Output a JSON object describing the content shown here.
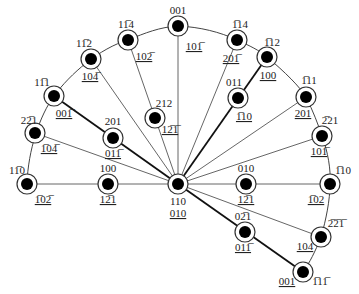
{
  "diagram": {
    "colors": {
      "line": "#333333",
      "node_fill": "#000000",
      "ring": "#333333",
      "background": "#ffffff"
    },
    "center": {
      "x": 178,
      "y": 184,
      "label_top": "110",
      "label_bottom": "010"
    },
    "nodes": [
      {
        "id": "n001top",
        "x": 178,
        "y": 26,
        "label": "001",
        "sub": "101̅",
        "lx": 178,
        "ly": 14,
        "sx": 194,
        "sy": 50
      },
      {
        "id": "n1b14",
        "x": 237,
        "y": 40,
        "label": "1̅14",
        "sub": "201̅",
        "lx": 240,
        "ly": 28,
        "sx": 231,
        "sy": 62
      },
      {
        "id": "n11b4",
        "x": 128,
        "y": 40,
        "label": "11̅4",
        "sub": "102̅",
        "lx": 126,
        "ly": 28,
        "sx": 144,
        "sy": 60
      },
      {
        "id": "n1b12",
        "x": 267,
        "y": 57,
        "label": "1̅12",
        "sub": "100",
        "lx": 272,
        "ly": 46,
        "sx": 268,
        "sy": 79
      },
      {
        "id": "n11b2",
        "x": 91,
        "y": 59,
        "label": "11̅2",
        "sub": "104̅",
        "lx": 84,
        "ly": 47,
        "sx": 90,
        "sy": 80
      },
      {
        "id": "n011",
        "x": 238,
        "y": 98,
        "label": "011",
        "sub": "1̅10",
        "lx": 234,
        "ly": 86,
        "sx": 244,
        "sy": 120
      },
      {
        "id": "n1b11",
        "x": 306,
        "y": 97,
        "label": "1̅11",
        "sub": "201",
        "lx": 309,
        "ly": 84,
        "sx": 303,
        "sy": 117
      },
      {
        "id": "n11b1",
        "x": 54,
        "y": 96,
        "label": "11̅1",
        "sub": "001̅",
        "lx": 42,
        "ly": 86,
        "sx": 64,
        "sy": 117
      },
      {
        "id": "n212",
        "x": 155,
        "y": 118,
        "label": "212",
        "sub": "12̅1̅",
        "lx": 164,
        "ly": 107,
        "sx": 170,
        "sy": 133
      },
      {
        "id": "n2b21",
        "x": 322,
        "y": 136,
        "label": "2̅21",
        "sub": "101̅",
        "lx": 330,
        "ly": 124,
        "sx": 319,
        "sy": 155
      },
      {
        "id": "n201",
        "x": 113,
        "y": 138,
        "label": "201",
        "sub": "011̅",
        "lx": 113,
        "ly": 125,
        "sx": 113,
        "sy": 157
      },
      {
        "id": "n22b1",
        "x": 35,
        "y": 133,
        "label": "22̅1",
        "sub": "1̅04̅",
        "lx": 29,
        "ly": 124,
        "sx": 49,
        "sy": 152
      },
      {
        "id": "n11b0",
        "x": 27,
        "y": 184,
        "label": "11̅0",
        "sub": "1̅02̅",
        "lx": 17,
        "ly": 174,
        "sx": 43,
        "sy": 203
      },
      {
        "id": "n100",
        "x": 108,
        "y": 184,
        "label": "100",
        "sub": "12̅1",
        "lx": 108,
        "ly": 172,
        "sx": 108,
        "sy": 203
      },
      {
        "id": "n010",
        "x": 246,
        "y": 184,
        "label": "010",
        "sub": "12̅1",
        "lx": 246,
        "ly": 172,
        "sx": 246,
        "sy": 203
      },
      {
        "id": "n1b10",
        "x": 330,
        "y": 184,
        "label": "1̅10",
        "sub": "1̅02",
        "lx": 343,
        "ly": 174,
        "sx": 316,
        "sy": 203
      },
      {
        "id": "n02b1",
        "x": 245,
        "y": 232,
        "label": "02̅1",
        "sub": "011̅",
        "lx": 243,
        "ly": 220,
        "sx": 243,
        "sy": 251
      },
      {
        "id": "n2b2b1",
        "x": 321,
        "y": 237,
        "label": "2̅2̅1̅",
        "sub": "104",
        "lx": 336,
        "ly": 227,
        "sx": 305,
        "sy": 250
      },
      {
        "id": "n001bot",
        "x": 303,
        "y": 272,
        "label": "1̅11̅",
        "sub": "001",
        "lx": 320,
        "ly": 285,
        "sx": 287,
        "sy": 285
      }
    ],
    "arc_path": "M27,184 C28,150 40,115 54,96 C70,74 100,48 128,40 C145,33 160,27 178,26 C200,27 220,32 237,40 C250,46 259,50 267,57 C285,72 300,87 306,97 C313,111 318,124 322,136 C328,152 331,170 330,184 C330,200 326,220 321,237 C315,252 310,262 303,272",
    "spokes": [
      {
        "to": "n001top",
        "bold": false
      },
      {
        "to": "n1b14",
        "bold": false
      },
      {
        "to": "n11b4",
        "bold": false
      },
      {
        "to": "n1b12",
        "bold": true
      },
      {
        "to": "n11b2",
        "bold": false
      },
      {
        "to": "n1b11",
        "bold": false
      },
      {
        "to": "n11b1",
        "bold": true
      },
      {
        "to": "n2b21",
        "bold": false
      },
      {
        "to": "n22b1",
        "bold": false
      },
      {
        "to": "n11b0",
        "bold": false
      },
      {
        "to": "n1b10",
        "bold": false
      },
      {
        "to": "n2b2b1",
        "bold": false
      },
      {
        "to": "n001bot",
        "bold": true
      }
    ]
  }
}
